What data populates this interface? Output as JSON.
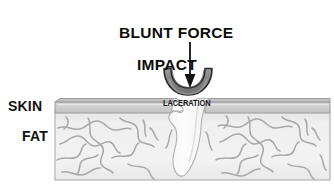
{
  "figure": {
    "title_line_1": "BLUNT FORCE",
    "title_line_2": "IMPACT",
    "labels": {
      "skin": "SKIN",
      "fat": "FAT",
      "laceration": "LACERATION"
    },
    "colors": {
      "background": "#ffffff",
      "text": "#111111",
      "arrow": "#111111",
      "impactor_fill": "#8c8c8c",
      "impactor_shade": "#6f6f6f",
      "impactor_outline": "#2a2a2a",
      "skin_fill": "#d2d2d2",
      "skin_top": "#bdbdbd",
      "skin_line": "#9a9a9a",
      "fat_fill": "#eeeeee",
      "fat_squiggle": "#a9a9a9",
      "wound_fill": "#fbfbfb",
      "wound_outline": "#b4b4b4",
      "block_outline": "#9c9c9c"
    },
    "geometry": {
      "block_left": 55,
      "block_right": 330,
      "skin_top": 99,
      "skin_bottom": 113,
      "fat_bottom": 180,
      "impactor_center_x": 188,
      "arrow_x": 190,
      "arrow_top": 42,
      "arrow_bottom": 88
    },
    "diagram_type": "anatomical-cross-section"
  }
}
